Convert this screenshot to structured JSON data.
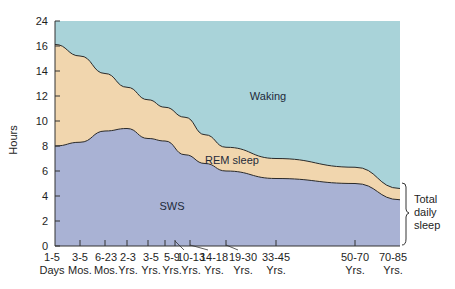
{
  "chart_data": {
    "type": "area",
    "title": "",
    "xlabel": "",
    "ylabel": "Hours",
    "ylim": [
      0,
      24
    ],
    "y_ticks": [
      "0",
      "2",
      "4",
      "6",
      "8",
      "10",
      "12",
      "14",
      "16",
      "24"
    ],
    "y_axis_note": "broken axis between 16 and 24",
    "grid": false,
    "categories": [
      {
        "line1": "1-5",
        "line2": "Days"
      },
      {
        "line1": "3-5",
        "line2": "Mos."
      },
      {
        "line1": "6-23",
        "line2": "Mos."
      },
      {
        "line1": "2-3",
        "line2": "Yrs."
      },
      {
        "line1": "3-5",
        "line2": "Yrs."
      },
      {
        "line1": "5-9",
        "line2": "Yrs."
      },
      {
        "line1": "10-13",
        "line2": "Yrs."
      },
      {
        "line1": "14-18",
        "line2": "Yrs."
      },
      {
        "line1": "19-30",
        "line2": "Yrs."
      },
      {
        "line1": "33-45",
        "line2": "Yrs."
      },
      {
        "line1": "50-70",
        "line2": "Yrs."
      },
      {
        "line1": "70-85",
        "line2": "Yrs."
      }
    ],
    "series": [
      {
        "name": "SWS",
        "color": "#a9b2d4",
        "values": [
          8.0,
          8.3,
          9.2,
          9.4,
          8.6,
          8.4,
          7.3,
          6.6,
          6.0,
          5.4,
          5.0,
          3.7
        ]
      },
      {
        "name": "REM sleep",
        "color": "#f1d6ae",
        "values": [
          8.5,
          6.9,
          4.6,
          3.3,
          3.1,
          2.7,
          3.0,
          2.3,
          1.9,
          1.6,
          1.3,
          0.9
        ]
      },
      {
        "name": "Waking",
        "color": "#a9d3d9",
        "values": [
          7.5,
          8.8,
          10.2,
          11.3,
          12.3,
          12.9,
          13.7,
          15.1,
          16.1,
          17.0,
          17.7,
          19.4
        ]
      }
    ],
    "total_sleep": [
      16.5,
      15.2,
      13.8,
      12.7,
      11.7,
      11.1,
      10.3,
      8.9,
      7.9,
      7.0,
      6.3,
      4.6
    ],
    "annotations": [
      "Waking",
      "REM sleep",
      "SWS",
      "Total daily sleep"
    ]
  },
  "labels": {
    "y_axis": "Hours",
    "waking": "Waking",
    "rem": "REM sleep",
    "sws": "SWS",
    "total_line1": "Total",
    "total_line2": "daily",
    "total_line3": "sleep"
  }
}
